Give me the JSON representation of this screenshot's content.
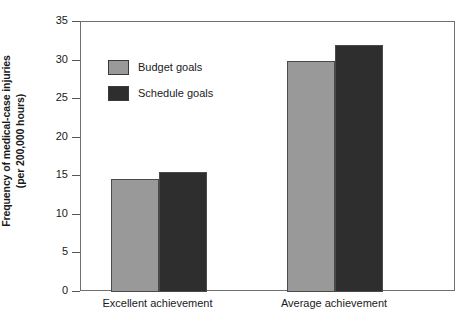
{
  "chart_data": {
    "type": "bar",
    "title": "",
    "subtitle": "",
    "xlabel": "",
    "ylabel_line1": "Frequency of medical-case injuries",
    "ylabel_line2": "(per 200,000 hours)",
    "categories": [
      "Excellent achievement",
      "Average achievement"
    ],
    "series": [
      {
        "name": "Budget goals",
        "values": [
          14.7,
          30.0
        ],
        "color": "#999999"
      },
      {
        "name": "Schedule goals",
        "values": [
          15.5,
          32.0
        ],
        "color": "#2e2e2e"
      }
    ],
    "ylim": [
      0,
      35
    ],
    "yticks": [
      0,
      5,
      10,
      15,
      20,
      25,
      30,
      35
    ],
    "ytick_labels": [
      "0",
      "5",
      "10",
      "15",
      "20",
      "25",
      "30",
      "35"
    ],
    "grid": false,
    "legend_position": "upper-left-inside",
    "frame": true,
    "border_color": "#6f6f6f"
  },
  "legend": {
    "items": [
      {
        "label": "Budget goals"
      },
      {
        "label": "Schedule goals"
      }
    ]
  }
}
